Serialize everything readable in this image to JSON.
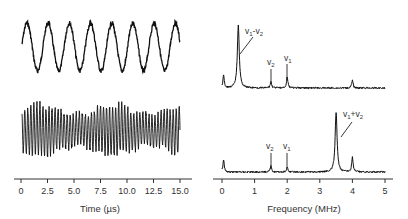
{
  "chart_data": [
    {
      "type": "line",
      "panel": "left",
      "xlabel": "Time (µs)",
      "ylabel": "",
      "xlim": [
        0,
        15
      ],
      "xticks": [
        "0",
        "2.5",
        "5.0",
        "7.5",
        "10.0",
        "12.5",
        "15.0"
      ],
      "grid": false,
      "series": [
        {
          "name": "top trace",
          "description": "sinusoidal waveform, ~7.5 periods over 15 µs (~0.5 MHz, difference frequency)",
          "frequency_MHz": 0.5
        },
        {
          "name": "bottom trace",
          "description": "high-frequency waveform (~3.5 MHz, sum frequency) with amplitude noise",
          "frequency_MHz": 3.5
        }
      ]
    },
    {
      "type": "line",
      "panel": "right",
      "xlabel": "Frequency (MHz)",
      "ylabel": "",
      "xlim": [
        0,
        5
      ],
      "xticks": [
        "0",
        "1",
        "2",
        "3",
        "4",
        "5"
      ],
      "grid": false,
      "series": [
        {
          "name": "top spectrum",
          "peaks": [
            {
              "x": 0.05,
              "height": 0.2
            },
            {
              "x": 0.5,
              "height": 1.0,
              "label": "ν1−ν2"
            },
            {
              "x": 1.5,
              "height": 0.1,
              "label": "ν2"
            },
            {
              "x": 2.0,
              "height": 0.18,
              "label": "ν1"
            },
            {
              "x": 4.0,
              "height": 0.12
            }
          ]
        },
        {
          "name": "bottom spectrum",
          "peaks": [
            {
              "x": 0.05,
              "height": 0.2
            },
            {
              "x": 1.5,
              "height": 0.1,
              "label": "ν2"
            },
            {
              "x": 2.0,
              "height": 0.08,
              "label": "ν1"
            },
            {
              "x": 3.5,
              "height": 1.0,
              "label": "ν1+ν2"
            },
            {
              "x": 4.0,
              "height": 0.25
            }
          ]
        }
      ],
      "annotations": [
        "ν1−ν2",
        "ν2",
        "ν1",
        "ν1+ν2"
      ]
    }
  ],
  "labels": {
    "left_xlabel": "Time (µs)",
    "right_xlabel": "Frequency (MHz)",
    "left_ticks": [
      "0",
      "2.5",
      "5.0",
      "7.5",
      "10.0",
      "12.5",
      "15.0"
    ],
    "right_ticks": [
      "0",
      "1",
      "2",
      "3",
      "4",
      "5"
    ],
    "nu": "v",
    "sub1": "1",
    "sub2": "2",
    "minus": "-",
    "plus": "+"
  }
}
